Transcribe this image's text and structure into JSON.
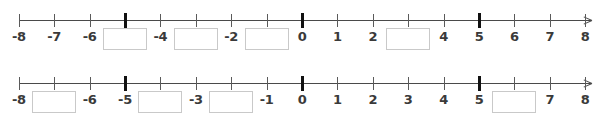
{
  "page": {
    "background_color": "#ffffff",
    "axis_color": "#4a4a4a",
    "tick_color": "#5a5a5a",
    "bold_tick_color": "#111111",
    "label_color": "#3a3a3a",
    "box_border_color": "#c9c9c9"
  },
  "numberlines": [
    {
      "id": "numberline-1",
      "min": -8,
      "max": 8,
      "step": 1,
      "bold_ticks": [
        -5,
        0,
        5
      ],
      "arrow_right": true,
      "labels": [
        {
          "value": -8,
          "text": "-8",
          "type": "label"
        },
        {
          "value": -7,
          "text": "-7",
          "type": "label"
        },
        {
          "value": -6,
          "text": "-6",
          "type": "label"
        },
        {
          "value": -5,
          "text": "",
          "type": "box"
        },
        {
          "value": -4,
          "text": "-4",
          "type": "label"
        },
        {
          "value": -3,
          "text": "",
          "type": "box"
        },
        {
          "value": -2,
          "text": "-2",
          "type": "label"
        },
        {
          "value": -1,
          "text": "",
          "type": "box"
        },
        {
          "value": 0,
          "text": "0",
          "type": "label"
        },
        {
          "value": 1,
          "text": "1",
          "type": "label"
        },
        {
          "value": 2,
          "text": "2",
          "type": "label"
        },
        {
          "value": 3,
          "text": "",
          "type": "box"
        },
        {
          "value": 4,
          "text": "4",
          "type": "label"
        },
        {
          "value": 5,
          "text": "5",
          "type": "label"
        },
        {
          "value": 6,
          "text": "6",
          "type": "label"
        },
        {
          "value": 7,
          "text": "7",
          "type": "label"
        },
        {
          "value": 8,
          "text": "8",
          "type": "label"
        }
      ]
    },
    {
      "id": "numberline-2",
      "min": -8,
      "max": 8,
      "step": 1,
      "bold_ticks": [
        -5,
        0,
        5
      ],
      "arrow_right": true,
      "labels": [
        {
          "value": -8,
          "text": "-8",
          "type": "label"
        },
        {
          "value": -7,
          "text": "",
          "type": "box"
        },
        {
          "value": -6,
          "text": "-6",
          "type": "label"
        },
        {
          "value": -5,
          "text": "-5",
          "type": "label"
        },
        {
          "value": -4,
          "text": "",
          "type": "box"
        },
        {
          "value": -3,
          "text": "-3",
          "type": "label"
        },
        {
          "value": -2,
          "text": "",
          "type": "box"
        },
        {
          "value": -1,
          "text": "-1",
          "type": "label"
        },
        {
          "value": 0,
          "text": "0",
          "type": "label"
        },
        {
          "value": 1,
          "text": "1",
          "type": "label"
        },
        {
          "value": 2,
          "text": "2",
          "type": "label"
        },
        {
          "value": 3,
          "text": "3",
          "type": "label"
        },
        {
          "value": 4,
          "text": "4",
          "type": "label"
        },
        {
          "value": 5,
          "text": "5",
          "type": "label"
        },
        {
          "value": 6,
          "text": "",
          "type": "box"
        },
        {
          "value": 7,
          "text": "7",
          "type": "label"
        },
        {
          "value": 8,
          "text": "8",
          "type": "label"
        }
      ]
    }
  ],
  "geometry": {
    "origin_x": 302,
    "unit_px": 35.4
  }
}
